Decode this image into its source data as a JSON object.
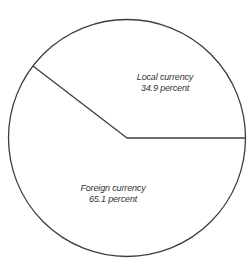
{
  "chart_data": {
    "type": "pie",
    "title": "",
    "units": "percent",
    "categories": [
      "Local currency",
      "Foreign currency"
    ],
    "values": [
      34.9,
      65.1
    ],
    "slices": [
      {
        "label": "Local currency",
        "value": 34.9,
        "value_label": "34.9 percent"
      },
      {
        "label": "Foreign currency",
        "value": 65.1,
        "value_label": "65.1 percent"
      }
    ],
    "legend": "none",
    "style": {
      "fill": "none",
      "stroke_color": "#3d3d3d",
      "label_color": "#333333",
      "background": "#ffffff",
      "label_font_style": "italic",
      "labels_inside": true
    },
    "layout": {
      "center_x": 127,
      "center_y": 138,
      "radius": 118.5,
      "boundary_angles_deg": [
        0,
        142.5
      ],
      "label_line_height": 10.5,
      "label_positions": [
        {
          "x": 165,
          "y": 80
        },
        {
          "x": 113,
          "y": 191
        }
      ]
    }
  }
}
